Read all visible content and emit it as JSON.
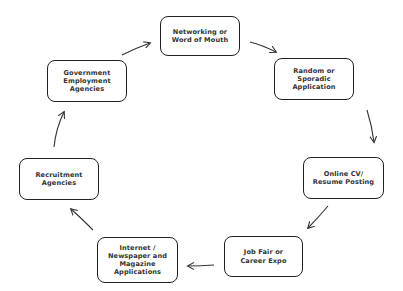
{
  "diagram": {
    "type": "cycle",
    "direction": "clockwise",
    "nodes": [
      {
        "id": "networking",
        "label": "Networking or\nWord of Mouth",
        "box": {
          "x": 160,
          "y": 16,
          "w": 80,
          "h": 40
        }
      },
      {
        "id": "random",
        "label": "Random or\nSporadic\nApplication",
        "box": {
          "x": 274,
          "y": 58,
          "w": 80,
          "h": 42
        }
      },
      {
        "id": "online",
        "label": "Online CV/\nResume Posting",
        "box": {
          "x": 303,
          "y": 157,
          "w": 81,
          "h": 42
        }
      },
      {
        "id": "jobfair",
        "label": "Job Fair or\nCareer Expo",
        "box": {
          "x": 224,
          "y": 236,
          "w": 79,
          "h": 41
        }
      },
      {
        "id": "internet",
        "label": "Internet /\nNewspaper and\nMagazine\nApplications",
        "box": {
          "x": 97,
          "y": 237,
          "w": 81,
          "h": 46
        }
      },
      {
        "id": "recruitment",
        "label": "Recruitment\nAgencies",
        "box": {
          "x": 19,
          "y": 158,
          "w": 80,
          "h": 42
        }
      },
      {
        "id": "government",
        "label": "Government\nEmployment\nAgencies",
        "box": {
          "x": 47,
          "y": 60,
          "w": 80,
          "h": 42
        }
      }
    ],
    "edges": [
      {
        "from": "networking",
        "to": "random"
      },
      {
        "from": "random",
        "to": "online"
      },
      {
        "from": "online",
        "to": "jobfair"
      },
      {
        "from": "jobfair",
        "to": "internet"
      },
      {
        "from": "internet",
        "to": "recruitment"
      },
      {
        "from": "recruitment",
        "to": "government"
      },
      {
        "from": "government",
        "to": "networking"
      }
    ]
  },
  "colors": {
    "border": "#222222",
    "text": "#333333",
    "arrow": "#333333",
    "background": "#ffffff"
  }
}
